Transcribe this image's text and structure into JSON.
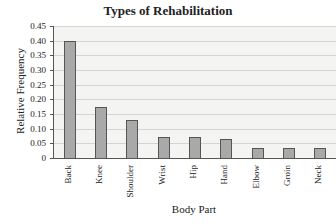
{
  "chart_data": {
    "type": "bar",
    "title": "Types of Rehabilitation",
    "xlabel": "Body Part",
    "ylabel": "Relative Frequency",
    "categories": [
      "Back",
      "Knee",
      "Shoulder",
      "Wrist",
      "Hip",
      "Hand",
      "Elbow",
      "Groin",
      "Neck"
    ],
    "values": [
      0.4,
      0.175,
      0.13,
      0.07,
      0.07,
      0.065,
      0.035,
      0.035,
      0.035
    ],
    "ylim": [
      0,
      0.45
    ],
    "yticks": [
      "0",
      "0.05",
      "0.10",
      "0.15",
      "0.20",
      "0.25",
      "0.30",
      "0.35",
      "0.40",
      "0.45"
    ],
    "grid": true,
    "legend": null,
    "bar_color": "#a9a9a9"
  }
}
